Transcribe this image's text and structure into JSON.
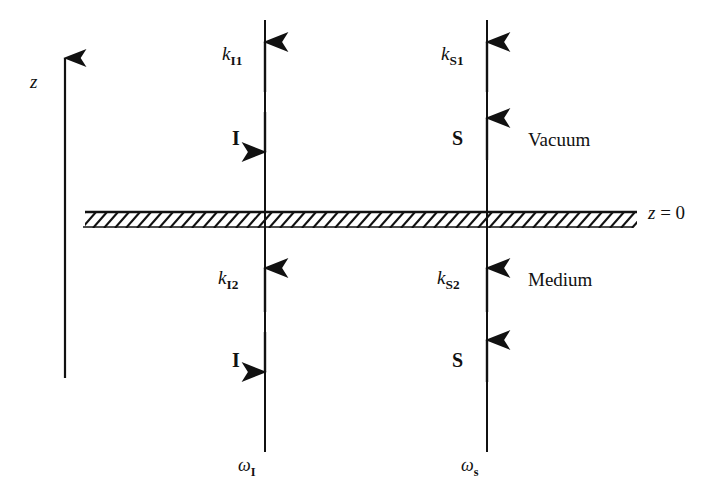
{
  "figure": {
    "type": "physics-schematic",
    "title": "",
    "background": "#ffffff",
    "ink_color": "#111111",
    "axis": {
      "name": "z-axis",
      "label": "z",
      "direction": "up",
      "x": 65,
      "y_top": 58,
      "y_bottom": 378,
      "label_x": 30,
      "label_y": 72
    },
    "interface": {
      "name": "boundary-z-equals-0",
      "label": "z = 0",
      "label_italic_part": "z",
      "label_rest": " = 0",
      "y": 212,
      "x_start": 85,
      "x_end": 637,
      "hatch_depth": 14,
      "hatch_spacing": 11,
      "label_x": 648,
      "label_y": 203
    },
    "regions": [
      {
        "name": "upper-region",
        "label": "Vacuum",
        "x": 528,
        "y": 130
      },
      {
        "name": "lower-region",
        "label": "Medium",
        "x": 528,
        "y": 270
      }
    ],
    "beams": [
      {
        "name": "incident-beam",
        "line_x": 265,
        "y_top": 20,
        "y_bottom": 452,
        "bottom_label": {
          "base": "ω",
          "sub": "I"
        },
        "bottom_label_x": 238,
        "bottom_label_y": 456,
        "arrows": [
          {
            "name": "k-I1-arrow",
            "direction": "up",
            "tip_y": 42,
            "tail_y": 92,
            "label_base": "k",
            "label_sub": "I1",
            "label_x": 222,
            "label_y": 44
          },
          {
            "name": "I-upper-arrow",
            "direction": "down",
            "tip_y": 152,
            "tail_y": 112,
            "label_base": "I",
            "label_sub": "",
            "label_x": 232,
            "label_y": 128
          },
          {
            "name": "k-I2-arrow",
            "direction": "up",
            "tip_y": 268,
            "tail_y": 312,
            "label_base": "k",
            "label_sub": "I2",
            "label_x": 218,
            "label_y": 268
          },
          {
            "name": "I-lower-arrow",
            "direction": "down",
            "tip_y": 372,
            "tail_y": 332,
            "label_base": "I",
            "label_sub": "",
            "label_x": 232,
            "label_y": 350
          }
        ]
      },
      {
        "name": "signal-beam",
        "line_x": 487,
        "y_top": 20,
        "y_bottom": 452,
        "bottom_label": {
          "base": "ω",
          "sub": "s"
        },
        "bottom_label_x": 461,
        "bottom_label_y": 456,
        "arrows": [
          {
            "name": "k-S1-arrow",
            "direction": "up",
            "tip_y": 42,
            "tail_y": 92,
            "label_base": "k",
            "label_sub": "S1",
            "label_x": 441,
            "label_y": 44
          },
          {
            "name": "S-upper-arrow",
            "direction": "up",
            "tip_y": 118,
            "tail_y": 160,
            "label_base": "S",
            "label_sub": "",
            "label_x": 452,
            "label_y": 128
          },
          {
            "name": "k-S2-arrow",
            "direction": "up",
            "tip_y": 268,
            "tail_y": 312,
            "label_base": "k",
            "label_sub": "S2",
            "label_x": 437,
            "label_y": 268
          },
          {
            "name": "S-lower-arrow",
            "direction": "up",
            "tip_y": 340,
            "tail_y": 382,
            "label_base": "S",
            "label_sub": "",
            "label_x": 452,
            "label_y": 350
          }
        ]
      }
    ]
  }
}
